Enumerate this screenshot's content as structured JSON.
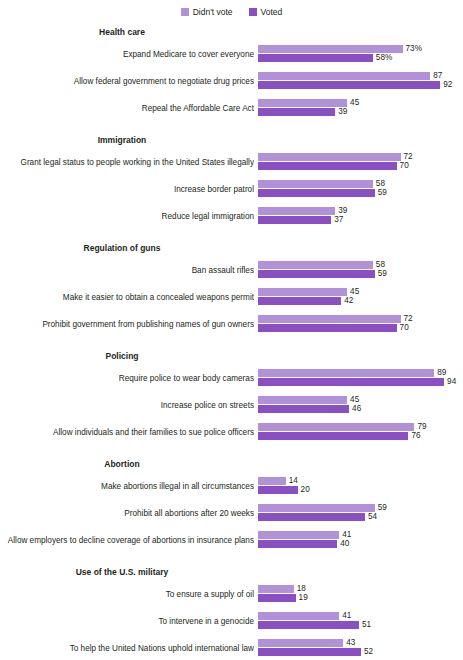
{
  "legend": {
    "items": [
      {
        "label": "Didn't vote",
        "color": "#b191d8",
        "key": "didnt_vote"
      },
      {
        "label": "Voted",
        "color": "#8b4fc4",
        "key": "voted"
      }
    ]
  },
  "chart_data": {
    "type": "bar",
    "orientation": "horizontal",
    "title": "",
    "xlabel": "",
    "ylabel": "",
    "xlim": [
      0,
      100
    ],
    "grid": false,
    "legend_position": "top-center",
    "value_suffix_first_row": "%",
    "series": [
      {
        "name": "Didn't vote",
        "color": "#b191d8"
      },
      {
        "name": "Voted",
        "color": "#8b4fc4"
      }
    ],
    "groups": [
      {
        "header": "Health care",
        "rows": [
          {
            "label": "Expand Medicare to cover everyone",
            "didnt_vote": 73,
            "voted": 58,
            "didnt_vote_text": "73%",
            "voted_text": "58%"
          },
          {
            "label": "Allow federal government to negotiate drug prices",
            "didnt_vote": 87,
            "voted": 92,
            "didnt_vote_text": "87",
            "voted_text": "92"
          },
          {
            "label": "Repeal the Affordable Care Act",
            "didnt_vote": 45,
            "voted": 39,
            "didnt_vote_text": "45",
            "voted_text": "39"
          }
        ]
      },
      {
        "header": "Immigration",
        "rows": [
          {
            "label": "Grant legal status to people working in the United States illegally",
            "didnt_vote": 72,
            "voted": 70,
            "didnt_vote_text": "72",
            "voted_text": "70"
          },
          {
            "label": "Increase border patrol",
            "didnt_vote": 58,
            "voted": 59,
            "didnt_vote_text": "58",
            "voted_text": "59"
          },
          {
            "label": "Reduce legal immigration",
            "didnt_vote": 39,
            "voted": 37,
            "didnt_vote_text": "39",
            "voted_text": "37"
          }
        ]
      },
      {
        "header": "Regulation of guns",
        "rows": [
          {
            "label": "Ban assault rifles",
            "didnt_vote": 58,
            "voted": 59,
            "didnt_vote_text": "58",
            "voted_text": "59"
          },
          {
            "label": "Make it easier to obtain a concealed weapons permit",
            "didnt_vote": 45,
            "voted": 42,
            "didnt_vote_text": "45",
            "voted_text": "42"
          },
          {
            "label": "Prohibit government from publishing names of gun owners",
            "didnt_vote": 72,
            "voted": 70,
            "didnt_vote_text": "72",
            "voted_text": "70"
          }
        ]
      },
      {
        "header": "Policing",
        "rows": [
          {
            "label": "Require police to wear body cameras",
            "didnt_vote": 89,
            "voted": 94,
            "didnt_vote_text": "89",
            "voted_text": "94"
          },
          {
            "label": "Increase police on streets",
            "didnt_vote": 45,
            "voted": 46,
            "didnt_vote_text": "45",
            "voted_text": "46"
          },
          {
            "label": "Allow individuals and their families to sue police officers",
            "didnt_vote": 79,
            "voted": 76,
            "didnt_vote_text": "79",
            "voted_text": "76"
          }
        ]
      },
      {
        "header": "Abortion",
        "rows": [
          {
            "label": "Make abortions illegal in all circumstances",
            "didnt_vote": 14,
            "voted": 20,
            "didnt_vote_text": "14",
            "voted_text": "20"
          },
          {
            "label": "Prohibit all abortions after 20 weeks",
            "didnt_vote": 59,
            "voted": 54,
            "didnt_vote_text": "59",
            "voted_text": "54"
          },
          {
            "label": "Allow employers to decline coverage of abortions in insurance plans",
            "didnt_vote": 41,
            "voted": 40,
            "didnt_vote_text": "41",
            "voted_text": "40"
          }
        ]
      },
      {
        "header": "Use of the U.S. military",
        "rows": [
          {
            "label": "To ensure a supply of oil",
            "didnt_vote": 18,
            "voted": 19,
            "didnt_vote_text": "18",
            "voted_text": "19"
          },
          {
            "label": "To intervene in a genocide",
            "didnt_vote": 41,
            "voted": 51,
            "didnt_vote_text": "41",
            "voted_text": "51"
          },
          {
            "label": "To help the United Nations uphold international law",
            "didnt_vote": 43,
            "voted": 52,
            "didnt_vote_text": "43",
            "voted_text": "52"
          }
        ]
      }
    ]
  }
}
